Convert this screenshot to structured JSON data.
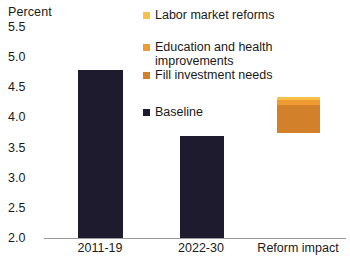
{
  "chart_data": {
    "type": "bar",
    "title": "",
    "subtitle": "",
    "xlabel": "",
    "ylabel": "Percent",
    "ylim": [
      2.0,
      5.5
    ],
    "yticks": [
      "5.5",
      "5.0",
      "4.5",
      "4.0",
      "3.5",
      "3.0",
      "2.5",
      "2.0"
    ],
    "ytick_values": [
      5.5,
      5.0,
      4.5,
      4.0,
      3.5,
      3.0,
      2.5,
      2.0
    ],
    "grid": false,
    "legend_position": "top-right",
    "categories": [
      "2011-19",
      "2022-30",
      "Reform impact"
    ],
    "series": [
      {
        "name": "Baseline",
        "color": "#1e1b2e",
        "values": [
          4.87,
          3.75,
          null
        ]
      },
      {
        "name": "Fill investment needs",
        "color": "#d2802a",
        "values": [
          null,
          null,
          0.47
        ]
      },
      {
        "name": "Education and health improvements",
        "color": "#ef9a32",
        "values": [
          null,
          null,
          0.08
        ]
      },
      {
        "name": "Labor market reforms",
        "color": "#f7c046",
        "values": [
          null,
          null,
          0.05
        ]
      }
    ],
    "reform_stack": {
      "base": 3.75,
      "segments": [
        {
          "name": "Fill investment needs",
          "value": 0.47,
          "color": "#d2802a"
        },
        {
          "name": "Education and health improvements",
          "value": 0.08,
          "color": "#ef9a32"
        },
        {
          "name": "Labor market reforms",
          "value": 0.05,
          "color": "#f7c046"
        }
      ],
      "top": 4.35
    }
  },
  "axis": {
    "y_title": "Percent",
    "ticks": [
      {
        "label": "5.5",
        "value": 5.5
      },
      {
        "label": "5.0",
        "value": 5.0
      },
      {
        "label": "4.5",
        "value": 4.5
      },
      {
        "label": "4.0",
        "value": 4.0
      },
      {
        "label": "3.5",
        "value": 3.5
      },
      {
        "label": "3.0",
        "value": 3.0
      },
      {
        "label": "2.5",
        "value": 2.5
      },
      {
        "label": "2.0",
        "value": 2.0
      }
    ],
    "x_labels": [
      {
        "label": "2011-19",
        "center": 100
      },
      {
        "label": "2022-30",
        "center": 201
      },
      {
        "label": "Reform impact",
        "center": 298
      }
    ]
  },
  "legend": {
    "items": [
      {
        "label": "Labor market reforms",
        "color": "#f7c046",
        "top": 4
      },
      {
        "label": "Education and health\nimprovements",
        "color": "#ef9a32",
        "top": 36
      },
      {
        "label": "Fill investment needs",
        "color": "#d2802a",
        "top": 64
      },
      {
        "label": "Baseline",
        "color": "#1e1b2e",
        "top": 101
      }
    ]
  },
  "bars": [
    {
      "name": "bar-2011-19",
      "series": "Baseline",
      "value": 4.87,
      "color": "#1e1b2e",
      "left": 78,
      "width": 45,
      "top": 70,
      "height": 168
    },
    {
      "name": "bar-2022-30",
      "series": "Baseline",
      "value": 3.75,
      "color": "#1e1b2e",
      "left": 180,
      "width": 44,
      "top": 136,
      "height": 102
    },
    {
      "name": "bar-reform-impact",
      "series": "Reform impact",
      "value": 4.35,
      "color": "#d2802a",
      "left": 277,
      "width": 43,
      "top": 97,
      "height": 36
    }
  ]
}
